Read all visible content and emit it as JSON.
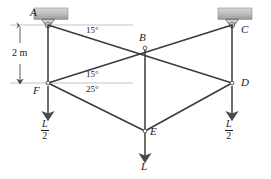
{
  "figure": {
    "units": "m",
    "line_color": "#3a3a3a",
    "text_color": "#1a1a1a",
    "support_fill": "#b8b8b8",
    "background": "#ffffff"
  },
  "nodes": [
    {
      "id": "A",
      "label": "A",
      "x": 48,
      "y": 25,
      "label_x": 30,
      "label_y": 8,
      "type": "pin-support"
    },
    {
      "id": "B",
      "label": "B",
      "x": 145,
      "y": 48,
      "label_x": 140,
      "label_y": 33,
      "type": "joint"
    },
    {
      "id": "C",
      "label": "C",
      "x": 232,
      "y": 25,
      "label_x": 240,
      "label_y": 24,
      "type": "pin-support"
    },
    {
      "id": "D",
      "label": "D",
      "x": 232,
      "y": 83,
      "label_x": 240,
      "label_y": 79,
      "type": "joint"
    },
    {
      "id": "E",
      "label": "E",
      "x": 145,
      "y": 131,
      "label_x": 150,
      "label_y": 128,
      "type": "joint"
    },
    {
      "id": "F",
      "label": "F",
      "x": 48,
      "y": 83,
      "label_x": 35,
      "label_y": 86,
      "type": "joint"
    }
  ],
  "members": [
    {
      "from": "A",
      "to": "D",
      "name": "member-AD-through-B"
    },
    {
      "from": "F",
      "to": "C",
      "name": "member-FC-through-B"
    },
    {
      "from": "A",
      "to": "F",
      "name": "member-AF-vertical"
    },
    {
      "from": "C",
      "to": "D",
      "name": "member-CD-vertical"
    },
    {
      "from": "B",
      "to": "E",
      "name": "member-BE-vertical"
    },
    {
      "from": "F",
      "to": "E",
      "name": "member-FE"
    },
    {
      "from": "E",
      "to": "D",
      "name": "member-ED"
    }
  ],
  "angles": [
    {
      "id": "ang-A",
      "value": "15°",
      "at": "A",
      "x": 88,
      "y": 30
    },
    {
      "id": "ang-F-upper",
      "value": "15°",
      "at": "F",
      "x": 88,
      "y": 73
    },
    {
      "id": "ang-F-lower",
      "value": "25°",
      "at": "F",
      "x": 88,
      "y": 88
    }
  ],
  "dimension": {
    "label": "2 m",
    "label_x": 14,
    "label_y": 49,
    "from_y": 25,
    "to_y": 83,
    "x": 20
  },
  "loads": [
    {
      "id": "load-F",
      "at": "F",
      "numerator": "L",
      "denominator": "2",
      "text": "L/2",
      "arrow_x": 48,
      "arrow_from_y": 86,
      "arrow_to_y": 118,
      "label_x": 43,
      "label_y": 122
    },
    {
      "id": "load-E",
      "at": "E",
      "numerator": "L",
      "denominator": "",
      "text": "L",
      "arrow_x": 145,
      "arrow_from_y": 133,
      "arrow_to_y": 160,
      "label_x": 142,
      "label_y": 163
    },
    {
      "id": "load-D",
      "at": "D",
      "numerator": "L",
      "denominator": "2",
      "text": "L/2",
      "arrow_x": 232,
      "arrow_from_y": 86,
      "arrow_to_y": 118,
      "label_x": 227,
      "label_y": 122
    }
  ],
  "supports": [
    {
      "id": "support-A",
      "label": "A",
      "block_x": 34,
      "block_y": 8,
      "block_w": 34,
      "block_h": 11
    },
    {
      "id": "support-C",
      "label": "C",
      "block_x": 218,
      "block_y": 8,
      "block_w": 34,
      "block_h": 11
    }
  ]
}
